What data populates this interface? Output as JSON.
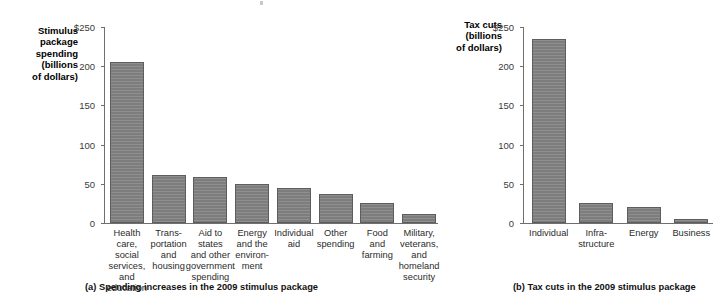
{
  "figure": {
    "width": 724,
    "height": 299,
    "bar_color": "#7d7d7d",
    "bar_border_color": "#5d5d5d",
    "axis_color": "#6f6f6f"
  },
  "panel_a": {
    "axis_title": "Stimulus\npackage\nspending\n(billions\nof dollars)",
    "caption": "(a) Spending increases in the 2009 stimulus package",
    "tick_labels": [
      "$250",
      "200",
      "150",
      "100",
      "50",
      "0"
    ]
  },
  "panel_b": {
    "axis_title": "Tax cuts\n(billions\nof dollars)",
    "caption": "(b) Tax cuts in the 2009 stimulus package",
    "tick_labels": [
      "$250",
      "200",
      "150",
      "100",
      "50",
      "0"
    ]
  },
  "chart_data": [
    {
      "type": "bar",
      "id": "panel-a",
      "title": "(a) Spending increases in the 2009 stimulus package",
      "xlabel": "",
      "ylabel": "Stimulus package spending (billions of dollars)",
      "ylim": [
        0,
        250
      ],
      "yticks": [
        0,
        50,
        100,
        150,
        200,
        250
      ],
      "ytick_labels": [
        "0",
        "50",
        "100",
        "150",
        "200",
        "$250"
      ],
      "grid": false,
      "legend": "none",
      "categories": [
        "Health care,\nsocial services,\nand education",
        "Trans-\nportation\nand\nhousing",
        "Aid to states\nand other\ngovernment\nspending",
        "Energy\nand the\nenviron-\nment",
        "Individual\naid",
        "Other\nspending",
        "Food\nand\nfarming",
        "Military,\nveterans,\nand\nhomeland\nsecurity"
      ],
      "values": [
        205,
        61,
        59,
        50,
        45,
        37,
        25,
        12
      ]
    },
    {
      "type": "bar",
      "id": "panel-b",
      "title": "(b) Tax cuts in the 2009 stimulus package",
      "xlabel": "",
      "ylabel": "Tax cuts (billions of dollars)",
      "ylim": [
        0,
        250
      ],
      "yticks": [
        0,
        50,
        100,
        150,
        200,
        250
      ],
      "ytick_labels": [
        "0",
        "50",
        "100",
        "150",
        "200",
        "$250"
      ],
      "grid": false,
      "legend": "none",
      "categories": [
        "Individual",
        "Infra-\nstructure",
        "Energy",
        "Business"
      ],
      "values": [
        235,
        25,
        20,
        5
      ]
    }
  ]
}
